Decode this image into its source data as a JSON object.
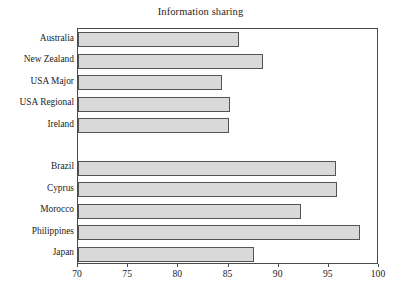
{
  "chart_data": {
    "type": "bar",
    "orientation": "horizontal",
    "title": "Information sharing",
    "xlabel": "",
    "ylabel": "",
    "xlim": [
      70,
      100
    ],
    "xticks": [
      70,
      75,
      80,
      85,
      90,
      95,
      100
    ],
    "xtick_labels": [
      "70",
      "75",
      "80",
      "85",
      "90",
      "95",
      "100"
    ],
    "grid": false,
    "legend": null,
    "bar_fill_color": "#d9d9d9",
    "bar_edge_color": "#545454",
    "axis_color": "#4a4a4a",
    "categories": [
      "Australia",
      "New Zealand",
      "USA Major",
      "USA Regional",
      "Ireland",
      "",
      "Brazil",
      "Cyprus",
      "Morocco",
      "Philippines",
      "Japan"
    ],
    "values": [
      86.0,
      88.4,
      84.4,
      85.1,
      85.0,
      null,
      95.7,
      95.8,
      92.2,
      98.1,
      87.5
    ],
    "groups": [
      {
        "name": "group-1",
        "categories": [
          "Australia",
          "New Zealand",
          "USA Major",
          "USA Regional",
          "Ireland"
        ],
        "values": [
          86.0,
          88.4,
          84.4,
          85.1,
          85.0
        ]
      },
      {
        "name": "group-2",
        "categories": [
          "Brazil",
          "Cyprus",
          "Morocco",
          "Philippines",
          "Japan"
        ],
        "values": [
          95.7,
          95.8,
          92.2,
          98.1,
          87.5
        ]
      }
    ]
  }
}
